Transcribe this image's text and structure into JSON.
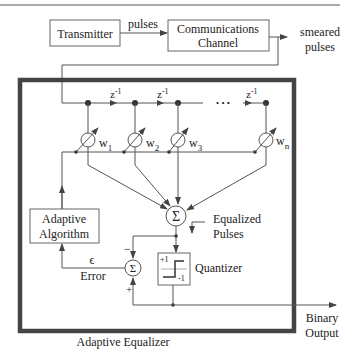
{
  "diagram": {
    "title": "Adaptive Equalizer",
    "top_rule": true,
    "blocks": {
      "transmitter": "Transmitter",
      "channel_line1": "Communications",
      "channel_line2": "Channel",
      "adaptive_line1": "Adaptive",
      "adaptive_line2": "Algorithm",
      "quantizer": "Quantizer",
      "quantizer_plus": "+1",
      "quantizer_minus": "-1"
    },
    "signals": {
      "pulses": "pulses",
      "smeared_line1": "smeared",
      "smeared_line2": "pulses",
      "equalized_line1": "Equalized",
      "equalized_line2": "Pulses",
      "epsilon": "ϵ",
      "error": "Error",
      "binary_line1": "Binary",
      "binary_line2": "Output"
    },
    "delays": [
      "z-1",
      "z-1",
      "z-1"
    ],
    "delay_base": "z",
    "delay_exp": "-1",
    "ellipsis": "• • •",
    "weights": [
      {
        "base": "w",
        "sub": "1"
      },
      {
        "base": "w",
        "sub": "2"
      },
      {
        "base": "w",
        "sub": "3"
      },
      {
        "base": "w",
        "sub": "n"
      }
    ],
    "summer_symbol": "Σ",
    "minus_sign": "−",
    "plus_sign": "+"
  }
}
